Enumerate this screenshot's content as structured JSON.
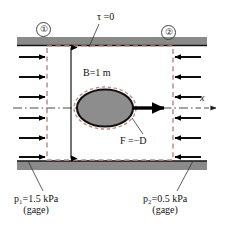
{
  "figure": {
    "labels": {
      "tau": "τ =0",
      "station_1": "①",
      "station_2": "②",
      "duct_width": "B=1 m",
      "force": "F =−D",
      "axis_x": "x",
      "p1_line1": "p₁=1.5 kPa",
      "p1_line2": "(gage)",
      "p2_line1": "p₂=0.5 kPa",
      "p2_line2": "(gage)"
    },
    "values": {
      "duct_width_value": 1,
      "duct_width_unit": "m",
      "p1_value": 1.5,
      "p1_unit": "kPa",
      "p1_reference": "gage",
      "p2_value": 0.5,
      "p2_unit": "kPa",
      "p2_reference": "gage",
      "wall_shear_stress": 0,
      "inlet_arrow_count": 6,
      "outlet_arrow_count": 6
    },
    "colors": {
      "wall_fill": "#8a8a8a",
      "wall_edge": "#1a1a1a",
      "control_volume_dash": "#c08a86",
      "body_fill": "#8d8d8d",
      "body_edge": "#111111",
      "arrow": "#000000",
      "background": "#ffffff",
      "text": "#111111"
    },
    "icons": {
      "inlet_arrow": "arrow-right-icon",
      "outlet_arrow": "arrow-left-icon",
      "drag_arrow": "arrow-right-bold-icon",
      "axis_arrow": "arrow-right-thin-icon",
      "dimension_arrow": "double-headed-vertical-arrow-icon"
    }
  }
}
